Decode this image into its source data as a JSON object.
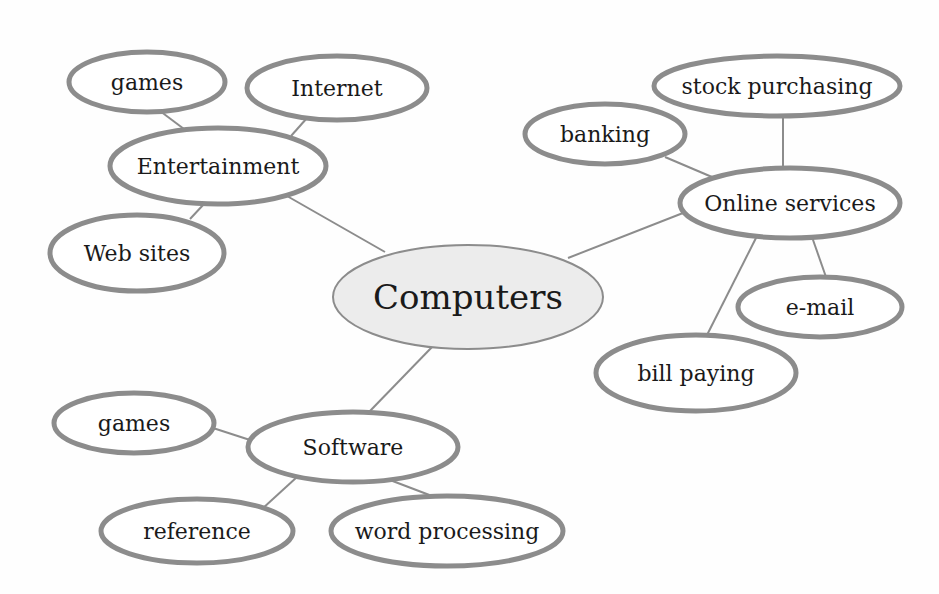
{
  "diagram": {
    "title": "Computers",
    "colors": {
      "edge": "#8c8c8c",
      "node_border": "#8c8c8c",
      "node_fill": "#ffffff",
      "center_fill": "#ececec",
      "text": "#1a1a1a"
    },
    "nodes": [
      {
        "id": "computers",
        "label": "Computers",
        "cx": 468,
        "cy": 297,
        "rx": 135,
        "ry": 52,
        "size": 34,
        "center": true
      },
      {
        "id": "entertainment",
        "label": "Entertainment",
        "cx": 218,
        "cy": 166,
        "rx": 108,
        "ry": 38,
        "size": 22
      },
      {
        "id": "games-ent",
        "label": "games",
        "cx": 147,
        "cy": 82,
        "rx": 78,
        "ry": 30,
        "size": 22
      },
      {
        "id": "internet",
        "label": "Internet",
        "cx": 337,
        "cy": 88,
        "rx": 90,
        "ry": 32,
        "size": 22
      },
      {
        "id": "web-sites",
        "label": "Web sites",
        "cx": 137,
        "cy": 253,
        "rx": 87,
        "ry": 38,
        "size": 22
      },
      {
        "id": "online-services",
        "label": "Online services",
        "cx": 790,
        "cy": 203,
        "rx": 110,
        "ry": 35,
        "size": 22
      },
      {
        "id": "stock-purchasing",
        "label": "stock purchasing",
        "cx": 777,
        "cy": 86,
        "rx": 123,
        "ry": 30,
        "size": 22
      },
      {
        "id": "banking",
        "label": "banking",
        "cx": 605,
        "cy": 134,
        "rx": 80,
        "ry": 30,
        "size": 22
      },
      {
        "id": "e-mail",
        "label": "e-mail",
        "cx": 820,
        "cy": 307,
        "rx": 82,
        "ry": 30,
        "size": 22
      },
      {
        "id": "bill-paying",
        "label": "bill paying",
        "cx": 696,
        "cy": 373,
        "rx": 100,
        "ry": 38,
        "size": 22
      },
      {
        "id": "software",
        "label": "Software",
        "cx": 353,
        "cy": 447,
        "rx": 105,
        "ry": 35,
        "size": 22
      },
      {
        "id": "games-sw",
        "label": "games",
        "cx": 134,
        "cy": 423,
        "rx": 80,
        "ry": 30,
        "size": 22
      },
      {
        "id": "reference",
        "label": "reference",
        "cx": 197,
        "cy": 531,
        "rx": 96,
        "ry": 32,
        "size": 22
      },
      {
        "id": "word-processing",
        "label": "word processing",
        "cx": 447,
        "cy": 531,
        "rx": 116,
        "ry": 35,
        "size": 22
      }
    ],
    "edges": [
      {
        "from": "computers",
        "to": "entertainment",
        "x1": 385,
        "y1": 252,
        "x2": 287,
        "y2": 196
      },
      {
        "from": "computers",
        "to": "online-services",
        "x1": 568,
        "y1": 258,
        "x2": 683,
        "y2": 213
      },
      {
        "from": "computers",
        "to": "software",
        "x1": 433,
        "y1": 346,
        "x2": 370,
        "y2": 411
      },
      {
        "from": "entertainment",
        "to": "games-ent",
        "x1": 160,
        "y1": 111,
        "x2": 184,
        "y2": 129
      },
      {
        "from": "entertainment",
        "to": "internet",
        "x1": 307,
        "y1": 118,
        "x2": 291,
        "y2": 136
      },
      {
        "from": "entertainment",
        "to": "web-sites",
        "x1": 204,
        "y1": 204,
        "x2": 190,
        "y2": 219
      },
      {
        "from": "online-services",
        "to": "stock-purchasing",
        "x1": 783,
        "y1": 116,
        "x2": 783,
        "y2": 168
      },
      {
        "from": "online-services",
        "to": "banking",
        "x1": 665,
        "y1": 157,
        "x2": 712,
        "y2": 177
      },
      {
        "from": "online-services",
        "to": "e-mail",
        "x1": 812,
        "y1": 237,
        "x2": 826,
        "y2": 277
      },
      {
        "from": "online-services",
        "to": "bill-paying",
        "x1": 757,
        "y1": 236,
        "x2": 707,
        "y2": 335
      },
      {
        "from": "software",
        "to": "games-sw",
        "x1": 213,
        "y1": 428,
        "x2": 250,
        "y2": 440
      },
      {
        "from": "software",
        "to": "reference",
        "x1": 297,
        "y1": 477,
        "x2": 262,
        "y2": 509
      },
      {
        "from": "software",
        "to": "word-processing",
        "x1": 390,
        "y1": 480,
        "x2": 432,
        "y2": 496
      }
    ]
  }
}
